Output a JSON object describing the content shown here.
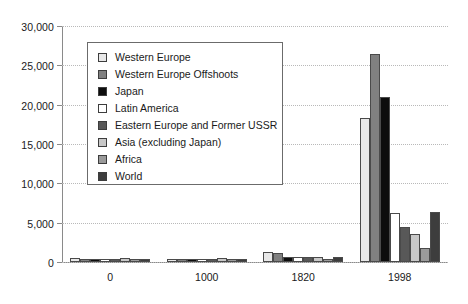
{
  "chart_data": {
    "type": "bar",
    "title": "",
    "subtitle": "",
    "xlabel": "",
    "ylabel": "",
    "categories": [
      "0",
      "1000",
      "1820",
      "1998"
    ],
    "ylim": [
      0,
      30000
    ],
    "ytick_values": [
      0,
      5000,
      10000,
      15000,
      20000,
      25000,
      30000
    ],
    "ytick_labels": [
      "0",
      "5,000",
      "10,000",
      "15,000",
      "20,000",
      "25,000",
      "30,000"
    ],
    "grid": true,
    "grid_style": "dotted horizontal",
    "legend_position": "upper left inside plot",
    "series": [
      {
        "name": "Western Europe",
        "color": "#e8e8e8",
        "values": [
          450,
          400,
          1232,
          18300
        ]
      },
      {
        "name": "Western Europe Offshoots",
        "color": "#808080",
        "values": [
          400,
          400,
          1201,
          26500
        ]
      },
      {
        "name": "Japan",
        "color": "#0d0d0d",
        "values": [
          400,
          425,
          669,
          21000
        ]
      },
      {
        "name": "Latin America",
        "color": "#ffffff",
        "values": [
          400,
          400,
          665,
          6200
        ]
      },
      {
        "name": "Eastern Europe and Former USSR",
        "color": "#585858",
        "values": [
          400,
          400,
          667,
          4400
        ]
      },
      {
        "name": "Asia (excluding Japan)",
        "color": "#c8c8c8",
        "values": [
          450,
          450,
          575,
          3500
        ]
      },
      {
        "name": "Africa",
        "color": "#9a9a9a",
        "values": [
          425,
          416,
          418,
          1800
        ]
      },
      {
        "name": "World",
        "color": "#3d3d3d",
        "values": [
          444,
          435,
          667,
          6400
        ]
      }
    ]
  },
  "legend": {
    "items": [
      {
        "label": "Western Europe"
      },
      {
        "label": "Western Europe Offshoots"
      },
      {
        "label": "Japan"
      },
      {
        "label": "Latin America"
      },
      {
        "label": "Eastern Europe and Former USSR"
      },
      {
        "label": "Asia (excluding Japan)"
      },
      {
        "label": "Africa"
      },
      {
        "label": "World"
      }
    ]
  }
}
